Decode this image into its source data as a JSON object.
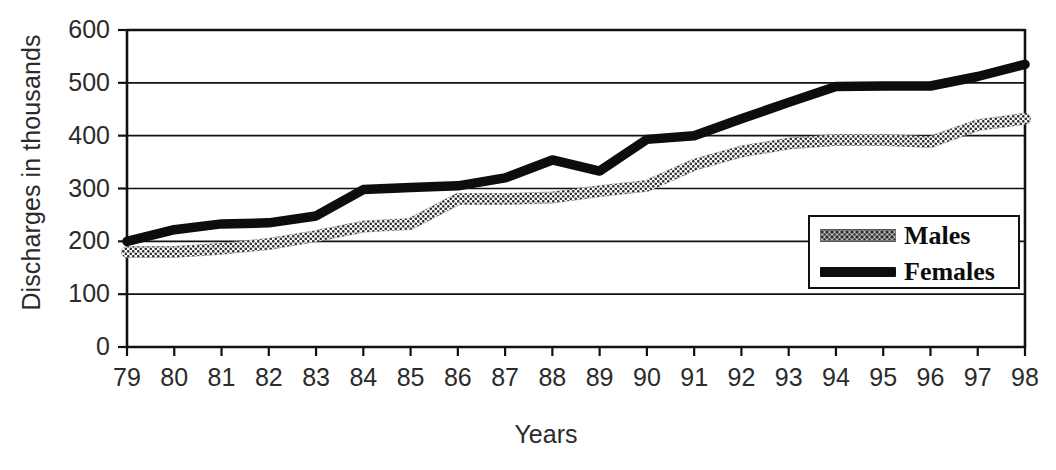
{
  "chart_data": {
    "type": "line",
    "title": "",
    "xlabel": "Years",
    "ylabel": "Discharges in thousands",
    "categories": [
      "79",
      "80",
      "81",
      "82",
      "83",
      "84",
      "85",
      "86",
      "87",
      "88",
      "89",
      "90",
      "91",
      "92",
      "93",
      "94",
      "95",
      "96",
      "97",
      "98"
    ],
    "x": [
      79,
      80,
      81,
      82,
      83,
      84,
      85,
      86,
      87,
      88,
      89,
      90,
      91,
      92,
      93,
      94,
      95,
      96,
      97,
      98
    ],
    "xlim": [
      79,
      98
    ],
    "ylim": [
      0,
      600
    ],
    "yticks": [
      0,
      100,
      200,
      300,
      400,
      500,
      600
    ],
    "ytick_labels": [
      "0",
      "100",
      "200",
      "300",
      "400",
      "500",
      "600"
    ],
    "grid": true,
    "grid_axis": "y",
    "legend_position": "center right",
    "series": [
      {
        "name": "Males",
        "style": "dotted",
        "color": "#2b2b2b",
        "values": [
          180,
          180,
          186,
          195,
          210,
          228,
          233,
          280,
          280,
          283,
          295,
          305,
          345,
          370,
          385,
          392,
          392,
          388,
          420,
          432
        ]
      },
      {
        "name": "Females",
        "style": "solid-thick",
        "color": "#0d0d0d",
        "values": [
          200,
          222,
          233,
          235,
          248,
          298,
          302,
          305,
          320,
          354,
          333,
          393,
          400,
          432,
          463,
          493,
          494,
          494,
          512,
          535
        ]
      }
    ]
  },
  "axis": {
    "y_title": "Discharges in thousands",
    "x_title": "Years"
  },
  "legend": {
    "items": [
      {
        "label": "Males",
        "swatch": "dotted-line-swatch"
      },
      {
        "label": "Females",
        "swatch": "solid-line-swatch"
      }
    ]
  }
}
